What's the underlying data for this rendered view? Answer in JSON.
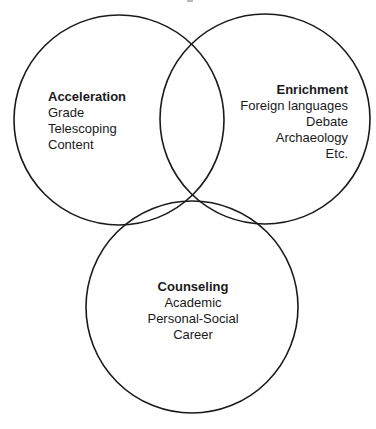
{
  "diagram": {
    "type": "venn",
    "stroke_color": "#1a1a1a",
    "background_color": "#ffffff",
    "sets": [
      {
        "id": "acceleration",
        "title": "Acceleration",
        "items": [
          "Grade",
          "Telescoping",
          "Content"
        ],
        "circle": {
          "cx": 119,
          "cy": 120,
          "r": 105
        }
      },
      {
        "id": "enrichment",
        "title": "Enrichment",
        "items": [
          "Foreign languages",
          "Debate",
          "Archaeology",
          "Etc."
        ],
        "circle": {
          "cx": 265,
          "cy": 119,
          "r": 105
        }
      },
      {
        "id": "counseling",
        "title": "Counseling",
        "items": [
          "Academic",
          "Personal-Social",
          "Career"
        ],
        "circle": {
          "cx": 192,
          "cy": 307,
          "r": 106
        }
      }
    ]
  }
}
